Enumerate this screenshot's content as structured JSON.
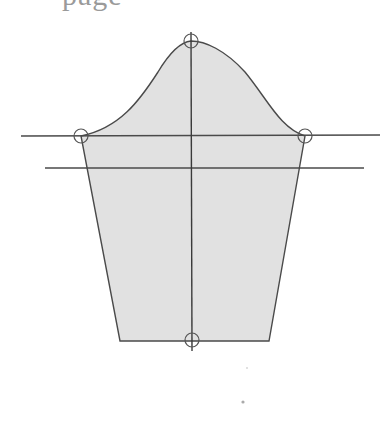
{
  "caption": {
    "text": "page"
  },
  "colors": {
    "fill": "#e1e1e1",
    "stroke": "#4a4a4a",
    "marker": "#555555",
    "background": "#ffffff"
  },
  "diagram": {
    "type": "sleeve-pattern",
    "cap_top": {
      "x": 191,
      "y": 41
    },
    "cap_left": {
      "x": 81,
      "y": 136
    },
    "cap_right": {
      "x": 305,
      "y": 136
    },
    "hem_center": {
      "x": 192,
      "y": 340
    },
    "hem_left": {
      "x": 120,
      "y": 341
    },
    "hem_right": {
      "x": 269,
      "y": 341
    },
    "guide_lines": [
      {
        "name": "bicep-line",
        "x1": 21,
        "y1": 136,
        "x2": 380,
        "y2": 135
      },
      {
        "name": "elbow-line",
        "x1": 45,
        "y1": 168,
        "x2": 364,
        "y2": 168
      },
      {
        "name": "center-grainline",
        "x1": 191,
        "y1": 32,
        "x2": 192,
        "y2": 351
      }
    ],
    "markers": [
      {
        "name": "marker-cap-top",
        "cx": 191,
        "cy": 41,
        "r": 7
      },
      {
        "name": "marker-cap-left",
        "cx": 81,
        "cy": 136,
        "r": 7
      },
      {
        "name": "marker-cap-right",
        "cx": 305,
        "cy": 136,
        "r": 7
      },
      {
        "name": "marker-hem-center",
        "cx": 192,
        "cy": 340,
        "r": 7
      }
    ]
  }
}
